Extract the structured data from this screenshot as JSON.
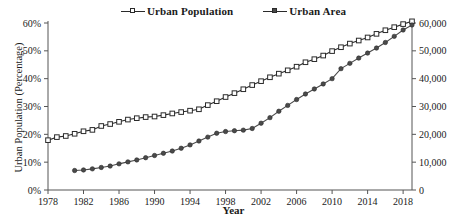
{
  "chart_data": {
    "type": "line",
    "title": "",
    "xlabel": "Year",
    "ylabel": "Urban Population (Percentage)",
    "y2label": "",
    "xlim": [
      1978,
      2019
    ],
    "ylim": [
      0,
      60
    ],
    "y2lim": [
      0,
      60000
    ],
    "grid": false,
    "legend_position": "top-center",
    "x_ticks": [
      1978,
      1982,
      1986,
      1990,
      1994,
      1998,
      2002,
      2006,
      2010,
      2014,
      2018
    ],
    "y_ticks": [
      "0%",
      "10%",
      "20%",
      "30%",
      "40%",
      "50%",
      "60%"
    ],
    "y_tick_values": [
      0,
      10,
      20,
      30,
      40,
      50,
      60
    ],
    "y2_ticks": [
      "0",
      "10,000",
      "20,000",
      "30,000",
      "40,000",
      "50,000",
      "60,000"
    ],
    "y2_tick_values": [
      0,
      10000,
      20000,
      30000,
      40000,
      50000,
      60000
    ],
    "series": [
      {
        "name": "Urban Population",
        "axis": "left",
        "unit": "percent",
        "marker": "open-square",
        "color": "#2a2a2a",
        "x": [
          1978,
          1979,
          1980,
          1981,
          1982,
          1983,
          1984,
          1985,
          1986,
          1987,
          1988,
          1989,
          1990,
          1991,
          1992,
          1993,
          1994,
          1995,
          1996,
          1997,
          1998,
          1999,
          2000,
          2001,
          2002,
          2003,
          2004,
          2005,
          2006,
          2007,
          2008,
          2009,
          2010,
          2011,
          2012,
          2013,
          2014,
          2015,
          2016,
          2017,
          2018,
          2019
        ],
        "values": [
          17.9,
          19.0,
          19.4,
          20.2,
          21.1,
          21.6,
          23.0,
          23.7,
          24.5,
          25.3,
          25.8,
          26.2,
          26.4,
          26.9,
          27.5,
          28.0,
          28.5,
          29.0,
          30.5,
          31.9,
          33.4,
          34.8,
          36.2,
          37.7,
          39.1,
          40.5,
          41.8,
          43.0,
          44.3,
          45.9,
          47.0,
          48.3,
          49.9,
          51.3,
          52.6,
          53.7,
          54.8,
          56.1,
          57.4,
          58.5,
          59.6,
          60.6
        ]
      },
      {
        "name": "Urban Area",
        "axis": "right",
        "unit": "sq-km",
        "marker": "filled-circle",
        "color": "#4a4a4a",
        "x": [
          1981,
          1982,
          1983,
          1984,
          1985,
          1986,
          1987,
          1988,
          1989,
          1990,
          1991,
          1992,
          1993,
          1994,
          1995,
          1996,
          1997,
          1998,
          1999,
          2000,
          2001,
          2002,
          2003,
          2004,
          2005,
          2006,
          2007,
          2008,
          2009,
          2010,
          2011,
          2012,
          2013,
          2014,
          2015,
          2016,
          2017,
          2018,
          2019
        ],
        "values": [
          7000,
          7200,
          7600,
          8100,
          8600,
          9400,
          10100,
          10800,
          11600,
          12400,
          13200,
          14000,
          15000,
          16200,
          17600,
          19000,
          20400,
          21000,
          21300,
          21500,
          22100,
          24000,
          26000,
          28300,
          30400,
          32500,
          34500,
          36300,
          38100,
          40000,
          43600,
          45500,
          47400,
          49200,
          51000,
          53000,
          55200,
          57500,
          59300
        ]
      }
    ]
  },
  "legend": {
    "entries": [
      {
        "label": "Urban Population",
        "marker": "open-square"
      },
      {
        "label": "Urban Area",
        "marker": "filled-square"
      }
    ]
  },
  "axis_titles": {
    "x": "Year",
    "y_left": "Urban Population (Percentage)"
  }
}
